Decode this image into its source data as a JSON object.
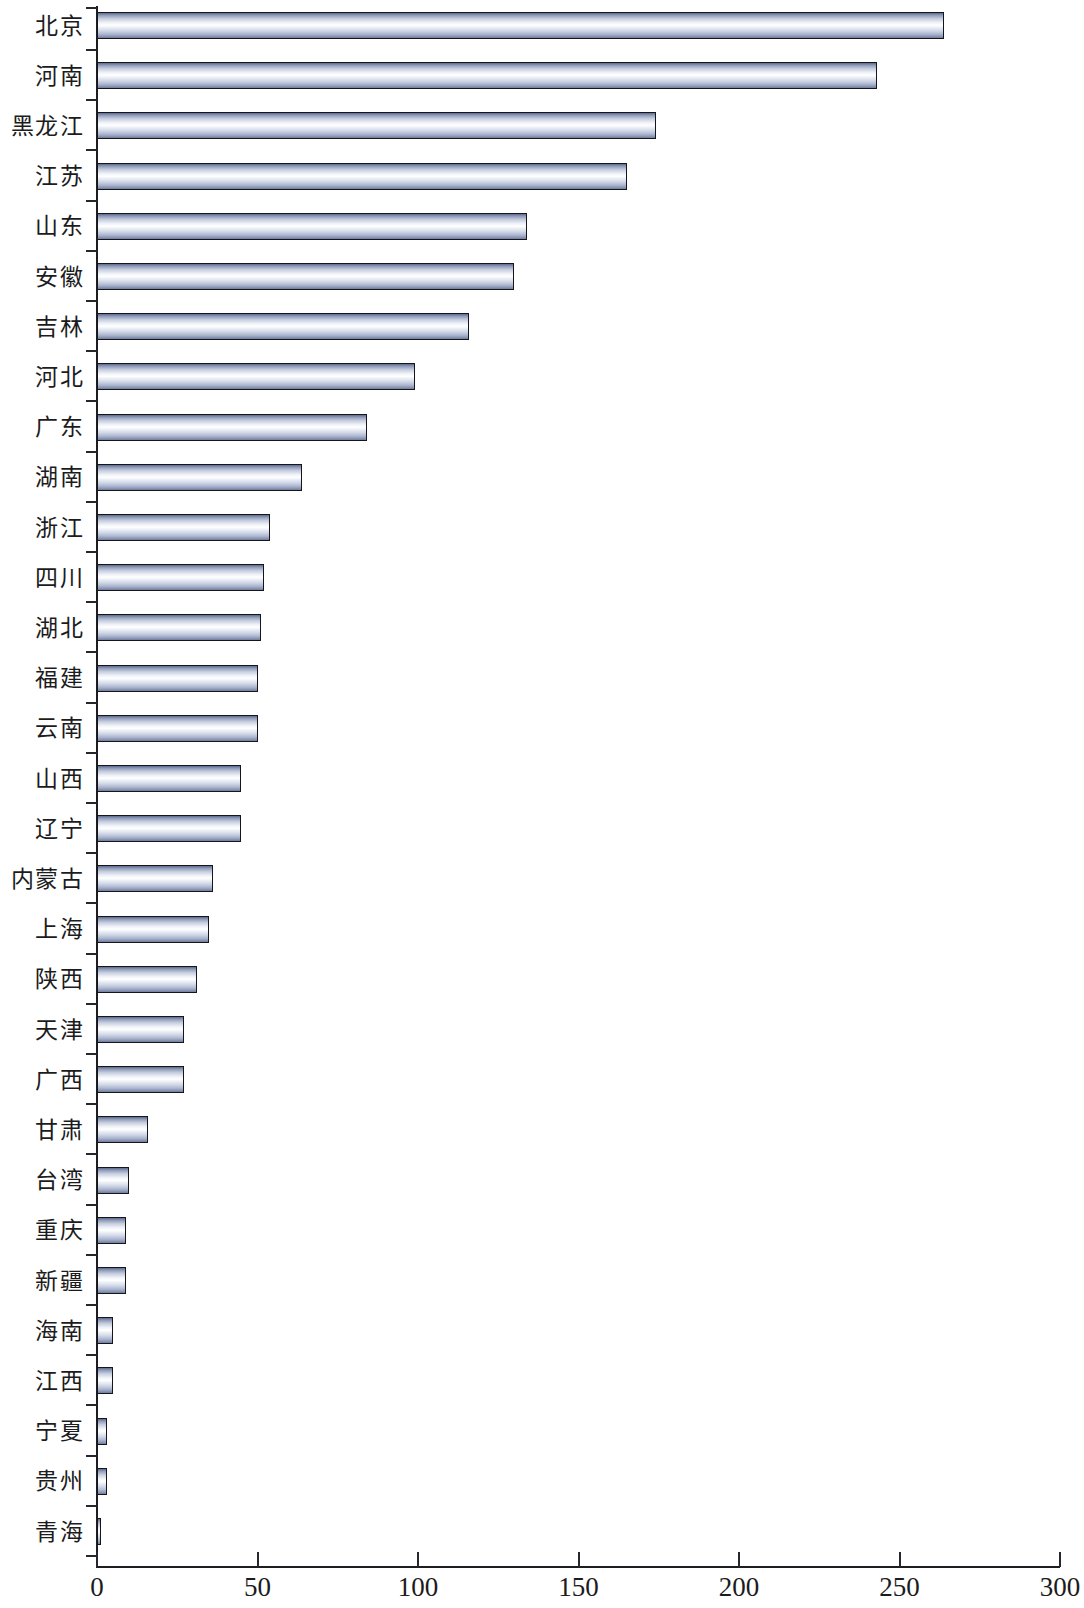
{
  "chart": {
    "type": "bar",
    "orientation": "horizontal",
    "title": "",
    "xlabel": "",
    "ylabel": "",
    "x_ticks": [
      "0",
      "50",
      "100",
      "150",
      "200",
      "250",
      "300"
    ],
    "colors": {
      "bar_outline": "#15151c",
      "bar_highlight": "#ffffff",
      "bar_shade": "#6f7b9d",
      "axis": "#1d1d22",
      "text": "#1b1b20",
      "background": "#ffffff"
    }
  },
  "chart_data": {
    "type": "bar",
    "title": "",
    "xlabel": "",
    "ylabel": "",
    "xlim": [
      0,
      300
    ],
    "grid": false,
    "legend": null,
    "orientation": "horizontal",
    "tick_labels_x": [
      0,
      50,
      100,
      150,
      200,
      250,
      300
    ],
    "categories": [
      "北京",
      "河南",
      "黑龙江",
      "江苏",
      "山东",
      "安徽",
      "吉林",
      "河北",
      "广东",
      "湖南",
      "浙江",
      "四川",
      "湖北",
      "福建",
      "云南",
      "山西",
      "辽宁",
      "内蒙古",
      "上海",
      "陕西",
      "天津",
      "广西",
      "甘肃",
      "台湾",
      "重庆",
      "新疆",
      "海南",
      "江西",
      "宁夏",
      "贵州",
      "青海"
    ],
    "values": [
      264,
      243,
      174,
      165,
      134,
      130,
      116,
      99,
      84,
      64,
      54,
      52,
      51,
      50,
      50,
      45,
      45,
      36,
      35,
      31,
      27,
      27,
      16,
      10,
      9,
      9,
      5,
      5,
      3,
      3,
      1
    ]
  }
}
